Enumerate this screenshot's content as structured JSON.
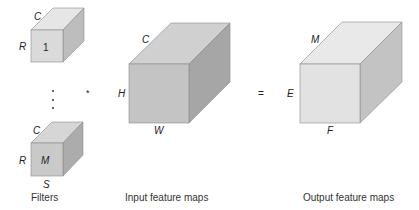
{
  "diagram": {
    "filters": {
      "caption": "Filters",
      "first": {
        "channel_label": "C",
        "height_label": "R",
        "index_label": "1"
      },
      "last": {
        "channel_label": "C",
        "height_label": "R",
        "index_label": "M",
        "width_label": "S"
      },
      "ellipsis": "⋮"
    },
    "operator_convolve": "*",
    "operator_equals": "=",
    "input": {
      "caption": "Input feature maps",
      "channel_label": "C",
      "height_label": "H",
      "width_label": "W"
    },
    "output": {
      "caption": "Output feature maps",
      "channel_label": "M",
      "height_label": "E",
      "width_label": "F"
    },
    "colors": {
      "filter_first": {
        "front": "#dadada",
        "top": "#e6e6e6",
        "side": "#bdbdbd"
      },
      "filter_last": {
        "front": "#c9c9c9",
        "top": "#d6d6d6",
        "side": "#acacac"
      },
      "input": {
        "front": "#c4c4c4",
        "top": "#d0d0d0",
        "side": "#a6a6a6"
      },
      "output": {
        "front": "#e2e2e2",
        "top": "#e9e9e9",
        "side": "#c3c3c3"
      }
    }
  }
}
